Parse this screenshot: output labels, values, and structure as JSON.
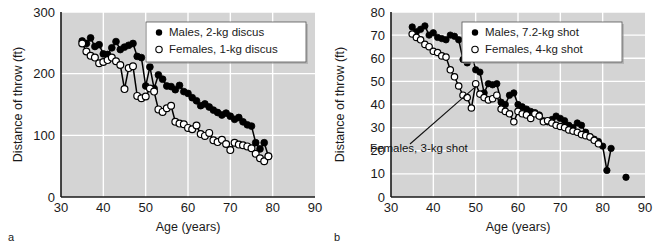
{
  "figure": {
    "panel_a_letter": "a",
    "panel_b_letter": "b"
  },
  "chart_data": [
    {
      "type": "scatter",
      "panel": "a",
      "title": "",
      "xlabel": "Age (years)",
      "ylabel": "Distance of throw (ft)",
      "xlim": [
        30,
        90
      ],
      "ylim": [
        0,
        300
      ],
      "xticks": [
        30,
        40,
        50,
        60,
        70,
        80,
        90
      ],
      "yticks": [
        0,
        100,
        200,
        300
      ],
      "grid": true,
      "background": "#d4d4d4",
      "gridline_color": "#ffffff",
      "legend_position": "top-right",
      "legend": [
        "Males, 2-kg discus",
        "Females, 1-kg discus"
      ],
      "series": [
        {
          "name": "Males, 2-kg discus",
          "marker": "filled-circle",
          "color": "#000000",
          "x": [
            35,
            36,
            37,
            38,
            39,
            40,
            41,
            42,
            43,
            44,
            45,
            46,
            47,
            48,
            49,
            50,
            51,
            52,
            53,
            54,
            55,
            56,
            57,
            58,
            59,
            60,
            61,
            62,
            63,
            64,
            65,
            66,
            67,
            68,
            69,
            70,
            71,
            72,
            73,
            74,
            75,
            76,
            77,
            78,
            79
          ],
          "values": [
            253,
            249,
            258,
            244,
            247,
            232,
            231,
            242,
            252,
            239,
            243,
            246,
            249,
            228,
            226,
            180,
            211,
            176,
            198,
            191,
            180,
            179,
            174,
            181,
            171,
            168,
            161,
            156,
            148,
            151,
            146,
            141,
            137,
            133,
            136,
            131,
            126,
            129,
            122,
            117,
            115,
            88,
            78,
            88,
            66
          ]
        },
        {
          "name": "Females, 1-kg discus",
          "marker": "open-circle",
          "color": "#000000",
          "x": [
            35,
            36,
            37,
            38,
            39,
            40,
            41,
            42,
            43,
            44,
            45,
            46,
            47,
            48,
            49,
            50,
            51,
            52,
            53,
            54,
            55,
            56,
            57,
            58,
            59,
            60,
            61,
            62,
            63,
            64,
            65,
            66,
            67,
            68,
            69,
            70,
            71,
            72,
            73,
            74,
            75,
            76,
            77,
            78,
            79
          ],
          "values": [
            249,
            236,
            229,
            226,
            217,
            219,
            222,
            226,
            220,
            214,
            175,
            209,
            212,
            164,
            160,
            163,
            176,
            171,
            142,
            138,
            144,
            148,
            122,
            119,
            118,
            112,
            110,
            116,
            102,
            99,
            104,
            92,
            89,
            93,
            86,
            76,
            88,
            85,
            84,
            82,
            79,
            70,
            63,
            58,
            66
          ]
        }
      ]
    },
    {
      "type": "scatter",
      "panel": "b",
      "title": "",
      "xlabel": "Age (years)",
      "ylabel": "Distance of throw (ft)",
      "xlim": [
        30,
        90
      ],
      "ylim": [
        0,
        80
      ],
      "xticks": [
        30,
        40,
        50,
        60,
        70,
        80,
        90
      ],
      "yticks": [
        0,
        10,
        20,
        30,
        40,
        50,
        60,
        70,
        80
      ],
      "grid": true,
      "background": "#d4d4d4",
      "gridline_color": "#ffffff",
      "legend_position": "top-right",
      "legend": [
        "Males, 7.2-kg shot",
        "Females, 4-kg shot"
      ],
      "annotation": {
        "text": "Females, 3-kg shot",
        "target_x": 50,
        "target_y": 49
      },
      "series": [
        {
          "name": "Males, 7.2-kg shot",
          "marker": "filled-circle",
          "color": "#000000",
          "x": [
            35,
            36,
            37,
            38,
            39,
            40,
            41,
            42,
            43,
            44,
            45,
            46,
            47,
            48,
            49,
            50,
            51,
            52,
            53,
            54,
            55,
            56,
            57,
            58,
            59,
            60,
            61,
            62,
            63,
            64,
            65,
            66,
            67,
            68,
            69,
            70,
            71,
            72,
            73,
            74,
            75,
            76,
            77,
            78,
            79,
            80,
            81,
            82,
            85.5
          ],
          "values": [
            73.5,
            71.5,
            72.5,
            74,
            70,
            71,
            69,
            68.5,
            68,
            70,
            69.5,
            68,
            59.5,
            58,
            62.5,
            55,
            54,
            45,
            49,
            48.5,
            49,
            41,
            40,
            44,
            45,
            40,
            39,
            38,
            37,
            36.5,
            35.5,
            33,
            32.5,
            33.5,
            35,
            34,
            33,
            31,
            30,
            32,
            31,
            28,
            26,
            25,
            24,
            22,
            11.5,
            21,
            8.5
          ]
        },
        {
          "name": "Females, 4-kg shot",
          "marker": "open-circle",
          "color": "#000000",
          "x": [
            35,
            36,
            37,
            38,
            39,
            40,
            41,
            42,
            43,
            44,
            45,
            46,
            47,
            48,
            49,
            50,
            51,
            52,
            53,
            54,
            55,
            56,
            57,
            58,
            59,
            60,
            61,
            62,
            63,
            64,
            65,
            66,
            67,
            68,
            69,
            70,
            71,
            72,
            73,
            74,
            75,
            76,
            77,
            78,
            79
          ],
          "values": [
            70.5,
            69,
            68,
            66,
            65,
            63,
            62.5,
            61,
            60.5,
            55,
            52,
            48,
            44,
            43,
            38.5,
            49,
            44.5,
            43,
            42,
            42.5,
            44,
            38,
            37,
            36,
            32.5,
            37,
            36,
            35.5,
            34,
            36,
            35,
            32.5,
            33,
            32,
            31,
            30.5,
            30,
            29,
            28.5,
            28,
            27,
            26.5,
            26,
            24.5,
            23
          ]
        }
      ]
    }
  ]
}
